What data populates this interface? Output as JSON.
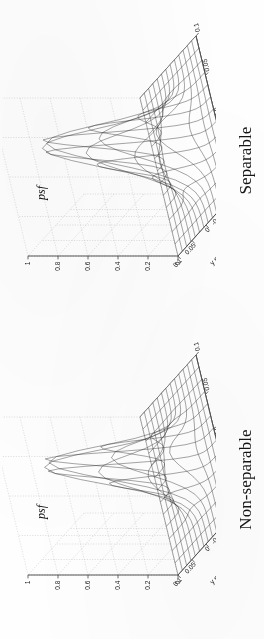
{
  "figure": {
    "background_color": "#ffffff",
    "orientation_note": "rotated",
    "panels": [
      {
        "id": "non-separable",
        "title": "Non-separable",
        "z_label": "psf",
        "x_axis": {
          "title": "x milliradians",
          "ticks": [
            "-0.1",
            "-0.05",
            "0",
            "0.05",
            "0.1"
          ]
        },
        "y_axis": {
          "title": "y milliradians",
          "ticks": [
            "-0.1",
            "-0.05",
            "0",
            "0.05",
            "0.1"
          ]
        },
        "z_axis": {
          "ticks": [
            "0",
            "0.2",
            "0.4",
            "0.6",
            "0.8",
            "1"
          ]
        }
      },
      {
        "id": "separable",
        "title": "Separable",
        "z_label": "psf",
        "x_axis": {
          "title": "x milliradians",
          "ticks": [
            "-0.1",
            "-0.05",
            "0",
            "0.05",
            "0.1"
          ]
        },
        "y_axis": {
          "title": "y milliradians",
          "ticks": [
            "-0.1",
            "-0.05",
            "0",
            "0.05",
            "0.1"
          ]
        },
        "z_axis": {
          "ticks": [
            "0",
            "0.2",
            "0.4",
            "0.6",
            "0.8",
            "1"
          ]
        }
      }
    ]
  },
  "chart_data": [
    {
      "type": "surface",
      "title": "Non-separable",
      "zlabel": "psf",
      "xlabel": "x milliradians",
      "ylabel": "y milliradians",
      "xticks": [
        -0.1,
        -0.05,
        0,
        0.05,
        0.1
      ],
      "yticks": [
        -0.1,
        -0.05,
        0,
        0.05,
        0.1
      ],
      "zticks": [
        0,
        0.2,
        0.4,
        0.6,
        0.8,
        1
      ],
      "xlim": [
        -0.1,
        0.1
      ],
      "ylim": [
        -0.1,
        0.1
      ],
      "zlim": [
        0,
        1
      ],
      "grid": true,
      "legend": "none",
      "peak_value": 1.0,
      "peak_x": 0.0,
      "peak_y": 0.0,
      "sigma_x": 0.021,
      "sigma_y": 0.021,
      "shape_note": "sharper narrower central lobe than separable case",
      "z_profile_along_x_at_y0": [
        0.0,
        0.0,
        0.01,
        0.05,
        0.22,
        0.62,
        1.0,
        0.62,
        0.22,
        0.05,
        0.01,
        0.0,
        0.0
      ],
      "z_profile_along_y_at_x0": [
        0.0,
        0.0,
        0.01,
        0.05,
        0.22,
        0.62,
        1.0,
        0.62,
        0.22,
        0.05,
        0.01,
        0.0,
        0.0
      ]
    },
    {
      "type": "surface",
      "title": "Separable",
      "zlabel": "psf",
      "xlabel": "x milliradians",
      "ylabel": "y milliradians",
      "xticks": [
        -0.1,
        -0.05,
        0,
        0.05,
        0.1
      ],
      "yticks": [
        -0.1,
        -0.05,
        0,
        0.05,
        0.1
      ],
      "zticks": [
        0,
        0.2,
        0.4,
        0.6,
        0.8,
        1
      ],
      "xlim": [
        -0.1,
        0.1
      ],
      "ylim": [
        -0.1,
        0.1
      ],
      "zlim": [
        0,
        1
      ],
      "grid": true,
      "legend": "none",
      "peak_value": 1.0,
      "peak_x": 0.0,
      "peak_y": 0.0,
      "sigma_x": 0.024,
      "sigma_y": 0.024,
      "shape_note": "slightly broader central lobe than non-separable case",
      "z_profile_along_x_at_y0": [
        0.0,
        0.01,
        0.03,
        0.09,
        0.28,
        0.66,
        1.0,
        0.66,
        0.28,
        0.09,
        0.03,
        0.01,
        0.0
      ],
      "z_profile_along_y_at_x0": [
        0.0,
        0.01,
        0.03,
        0.09,
        0.28,
        0.66,
        1.0,
        0.66,
        0.28,
        0.09,
        0.03,
        0.01,
        0.0
      ]
    }
  ]
}
